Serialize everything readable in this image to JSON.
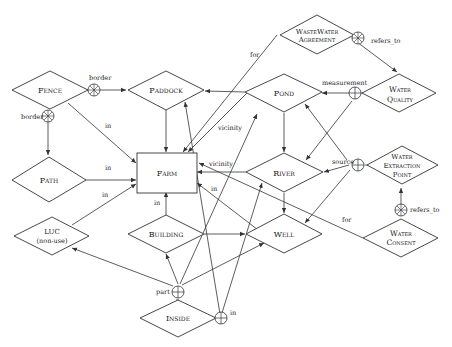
{
  "diagram": {
    "type": "entity-relationship",
    "entities": {
      "farm": "Farm",
      "fence": "Fence",
      "paddock": "Paddock",
      "pond": "Pond",
      "wastewater_agreement_1": "WasteWater",
      "wastewater_agreement_2": "Agreement",
      "water_quality_1": "Water",
      "water_quality_2": "Quality",
      "path": "Path",
      "river": "River",
      "water_extraction_1": "Water",
      "water_extraction_2": "Extraction",
      "water_extraction_3": "Point",
      "luc_1": "LUC",
      "luc_2": "(non-use)",
      "building": "Building",
      "well": "Well",
      "water_consent_1": "Water",
      "water_consent_2": "Consent",
      "inside": "Inside"
    },
    "edge_labels": {
      "border_top": "border",
      "border_left": "border",
      "fence_in": "in",
      "path_in": "in",
      "luc_in": "in",
      "building_in": "in",
      "for_wastewater": "for",
      "refers_to_top": "refers_to",
      "measurement": "measurement",
      "vicinity_pond": "vicinity",
      "vicinity_river": "vicinity",
      "river_in": "in",
      "source": "source",
      "for_consent": "for",
      "refers_to_bottom": "refers_to",
      "part": "part",
      "inside_in": "in"
    },
    "symbol_legend": {
      "circle-star": "aggregation junction",
      "circle-plus": "composition junction"
    }
  }
}
